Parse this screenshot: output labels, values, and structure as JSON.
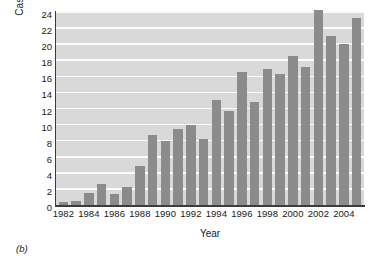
{
  "caption": "(b)",
  "chart_data": {
    "type": "bar",
    "title": "",
    "xlabel": "Year",
    "ylabel": "Cases (thousands)",
    "categories": [
      "1982",
      "1983",
      "1984",
      "1985",
      "1986",
      "1987",
      "1988",
      "1989",
      "1990",
      "1991",
      "1992",
      "1993",
      "1994",
      "1995",
      "1996",
      "1997",
      "1998",
      "1999",
      "2000",
      "2001",
      "2002",
      "2003",
      "2004",
      "2005"
    ],
    "values": [
      0.35,
      0.5,
      1.5,
      2.6,
      1.4,
      2.3,
      4.8,
      8.7,
      7.9,
      9.4,
      9.9,
      8.2,
      13.0,
      11.7,
      16.5,
      12.8,
      16.9,
      16.3,
      18.5,
      17.2,
      24.2,
      21.0,
      20.0,
      23.3
    ],
    "xtick_labels": [
      "1982",
      "1984",
      "1986",
      "1988",
      "1990",
      "1992",
      "1994",
      "1996",
      "1998",
      "2000",
      "2002",
      "2004"
    ],
    "ytick_labels": [
      "0",
      "2",
      "4",
      "6",
      "8",
      "10",
      "12",
      "14",
      "16",
      "18",
      "20",
      "22",
      "24"
    ],
    "ylim": [
      0,
      24
    ],
    "ytick_step": 2,
    "grid": true,
    "legend": null,
    "bar_color": "#8b8b8b",
    "plot_background": "#d9d9d9",
    "gridline_color": "#fbfbfb",
    "axis_color": "#3b3b3b"
  }
}
